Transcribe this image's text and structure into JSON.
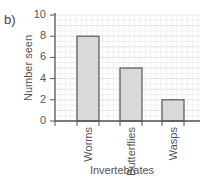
{
  "panel_label": "b)",
  "chart_data": {
    "type": "bar",
    "title": "",
    "xlabel": "Invertebrates",
    "ylabel": "Number seen",
    "categories": [
      "Worms",
      "Butterflies",
      "Wasps"
    ],
    "values": [
      8,
      5,
      2
    ],
    "ylim": [
      0,
      10
    ],
    "yticks": [
      0,
      2,
      4,
      6,
      8,
      10
    ],
    "grid": true,
    "legend": null,
    "bar_color": "#d9d9d9",
    "bar_edge_color": "#555555"
  }
}
